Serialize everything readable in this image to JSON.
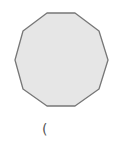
{
  "diagram": {
    "shape": "decagon",
    "sides": 10,
    "fill": "#e6e6e6",
    "stroke": "#777777",
    "points": "47,13 75,13 99,31 108,60 99,89 75,106 47,106 23,89 15,60 23,31"
  },
  "label": {
    "text": "("
  }
}
